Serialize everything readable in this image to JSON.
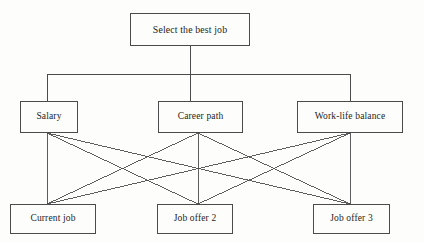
{
  "diagram": {
    "title": "Select the best job",
    "type": "decision-hierarchy",
    "background_color": "#fdfdfb",
    "line_color": "#4b4b4b",
    "text_color": "#1d1d1d",
    "levels": {
      "goal": {
        "label": "Goal",
        "nodes": [
          {
            "id": "goal",
            "label": "Select the best job",
            "x": 130,
            "y": 13,
            "w": 120,
            "h": 33
          }
        ]
      },
      "criteria": {
        "label": "Criteria",
        "nodes": [
          {
            "id": "salary",
            "label": "Salary",
            "x": 20,
            "y": 101,
            "w": 58,
            "h": 32
          },
          {
            "id": "career",
            "label": "Career path",
            "x": 158,
            "y": 101,
            "w": 85,
            "h": 32
          },
          {
            "id": "worklife",
            "label": "Work-life balance",
            "x": 297,
            "y": 101,
            "w": 106,
            "h": 32
          }
        ]
      },
      "alternatives": {
        "label": "Alternatives",
        "nodes": [
          {
            "id": "current",
            "label": "Current job",
            "x": 10,
            "y": 204,
            "w": 86,
            "h": 30
          },
          {
            "id": "offer2",
            "label": "Job offer 2",
            "x": 157,
            "y": 204,
            "w": 76,
            "h": 30
          },
          {
            "id": "offer3",
            "label": "Job offer 3",
            "x": 313,
            "y": 204,
            "w": 77,
            "h": 30
          }
        ]
      }
    },
    "connectors": {
      "goal_stem": {
        "x": 190,
        "y1": 46,
        "y2": 74
      },
      "bus": {
        "y": 74,
        "x1": 47,
        "x2": 350
      },
      "bus_drops": [
        {
          "x": 47,
          "y1": 74,
          "y2": 101
        },
        {
          "x": 190,
          "y1": 74,
          "y2": 101
        },
        {
          "x": 350,
          "y1": 74,
          "y2": 101
        }
      ],
      "criteria_anchors": [
        {
          "id": "salary",
          "x": 47,
          "y": 133
        },
        {
          "id": "career",
          "x": 198,
          "y": 133
        },
        {
          "id": "worklife",
          "x": 350,
          "y": 133
        }
      ],
      "alternative_anchors": [
        {
          "id": "current",
          "x": 47,
          "y": 204
        },
        {
          "id": "offer2",
          "x": 198,
          "y": 204
        },
        {
          "id": "offer3",
          "x": 350,
          "y": 204
        }
      ],
      "edges": [
        {
          "from": "salary",
          "to": "current"
        },
        {
          "from": "salary",
          "to": "offer2"
        },
        {
          "from": "salary",
          "to": "offer3"
        },
        {
          "from": "career",
          "to": "current"
        },
        {
          "from": "career",
          "to": "offer2"
        },
        {
          "from": "career",
          "to": "offer3"
        },
        {
          "from": "worklife",
          "to": "current"
        },
        {
          "from": "worklife",
          "to": "offer2"
        },
        {
          "from": "worklife",
          "to": "offer3"
        }
      ]
    }
  }
}
